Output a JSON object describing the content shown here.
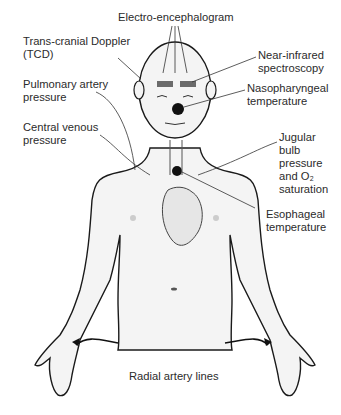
{
  "diagram": {
    "type": "anatomical-monitoring-diagram",
    "colors": {
      "outline": "#1a1a1a",
      "skin": "#f4f4f4",
      "sensor": "#6b6b6b",
      "probe": "#111111",
      "line": "#333333"
    },
    "labels": {
      "eeg": "Electro-encephalogram",
      "tcd": "Trans-cranial Doppler\n(TCD)",
      "nirs": "Near-infrared\nspectroscopy",
      "pap": "Pulmonary artery\npressure",
      "naso": "Nasopharyngeal\ntemperature",
      "cvp": "Central venous\npressure",
      "jugular": "Jugular\nbulb\npressure\nand O₂\nsaturation",
      "eso": "Esophageal\ntemperature",
      "radial": "Radial artery lines"
    }
  }
}
